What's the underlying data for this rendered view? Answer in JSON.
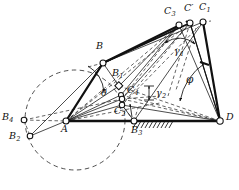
{
  "figure": {
    "width": 239,
    "height": 190,
    "background": "#ffffff",
    "stroke_color": "#111111",
    "dash_color": "#222222"
  },
  "labels": {
    "B": "B",
    "B1_base": "B",
    "B1_sub": "1",
    "B2_base": "B",
    "B2_sub": "2",
    "B3_base": "B",
    "B3_sub": "3",
    "B4_base": "B",
    "B4_sub": "4",
    "C1_base": "C",
    "C1_sub": "1",
    "C2_base": "C",
    "C2_sub": "2",
    "C3_base": "C",
    "C3_sub": "3",
    "C4_base": "C",
    "C4_sub": "4",
    "Cprime": "C′",
    "A": "A",
    "D": "D",
    "theta": "θ",
    "phi": "φ",
    "gamma1_base": "γ",
    "gamma1_sub": "1",
    "gamma2_base": "γ",
    "gamma2_sub": "2"
  },
  "nodes": [
    {
      "name": "A",
      "x": 66,
      "y": 121,
      "r": 3.0,
      "kind": "joint-open"
    },
    {
      "name": "B",
      "x": 103,
      "y": 63,
      "r": 3.0,
      "kind": "joint-open"
    },
    {
      "name": "B1",
      "x": 119,
      "y": 86,
      "r": 2.6,
      "kind": "joint-square"
    },
    {
      "name": "B2",
      "x": 30,
      "y": 136,
      "r": 2.8,
      "kind": "joint-open"
    },
    {
      "name": "B3",
      "x": 134,
      "y": 121,
      "r": 3.0,
      "kind": "joint-open"
    },
    {
      "name": "B4",
      "x": 24,
      "y": 120,
      "r": 2.8,
      "kind": "joint-open"
    },
    {
      "name": "C1",
      "x": 203,
      "y": 22,
      "r": 3.0,
      "kind": "joint-open"
    },
    {
      "name": "Cp",
      "x": 190,
      "y": 23,
      "r": 3.0,
      "kind": "joint-open"
    },
    {
      "name": "C3",
      "x": 179,
      "y": 25,
      "r": 3.0,
      "kind": "joint-open"
    },
    {
      "name": "C4",
      "x": 122,
      "y": 99,
      "r": 2.7,
      "kind": "joint-open"
    },
    {
      "name": "C2",
      "x": 122,
      "y": 105,
      "r": 2.7,
      "kind": "joint-open"
    },
    {
      "name": "Cm",
      "x": 121,
      "y": 95,
      "r": 2.5,
      "kind": "joint-open"
    },
    {
      "name": "D",
      "x": 220,
      "y": 121,
      "r": 3.2,
      "kind": "joint-open"
    }
  ],
  "label_positions": [
    {
      "key": "B",
      "x": 96,
      "y": 46
    },
    {
      "key": "B1",
      "x": 113,
      "y": 72
    },
    {
      "key": "B2",
      "x": 12,
      "y": 136
    },
    {
      "key": "B3",
      "x": 133,
      "y": 128
    },
    {
      "key": "B4",
      "x": 5,
      "y": 113
    },
    {
      "key": "C1",
      "x": 200,
      "y": 5
    },
    {
      "key": "Cprime",
      "x": 185,
      "y": 6
    },
    {
      "key": "C3",
      "x": 166,
      "y": 10
    },
    {
      "key": "C4",
      "x": 128,
      "y": 88
    },
    {
      "key": "C2",
      "x": 116,
      "y": 108
    },
    {
      "key": "A",
      "x": 62,
      "y": 126
    },
    {
      "key": "D",
      "x": 226,
      "y": 115
    },
    {
      "key": "theta",
      "x": 103,
      "y": 92
    },
    {
      "key": "phi",
      "x": 187,
      "y": 80
    },
    {
      "key": "gamma1",
      "x": 175,
      "y": 50
    },
    {
      "key": "gamma2",
      "x": 157,
      "y": 92
    }
  ],
  "geometry": {
    "ground_line": {
      "x1": 66,
      "y1": 121,
      "x2": 220,
      "y2": 121,
      "weight": "heavy"
    },
    "coupler_bar": {
      "points": "103,63 179,25",
      "weight": "heavy"
    },
    "crank_AB": {
      "points": "66,121 103,63",
      "weight": "heavy"
    },
    "rocker_CD": {
      "points": "203,22 220,121",
      "weight": "heavy"
    },
    "dashed_circle": {
      "cx": 75,
      "cy": 120,
      "r": 50
    },
    "hatch": {
      "x1": 136,
      "y1": 121,
      "x2": 172,
      "y2": 121,
      "count": 9
    },
    "tick_marks": [
      {
        "x": 205,
        "y": 65,
        "label": "rocker-tick"
      },
      {
        "x": 190,
        "y": 24,
        "label": "coupler-tick"
      }
    ]
  },
  "angles": {
    "gamma1": {
      "vertex_x": 181,
      "vertex_y": 26,
      "note": "transmission angle at coupler apex, double arrow arc"
    },
    "gamma2": {
      "note": "bracketed small angle near C4, vertical bracket with arrows"
    },
    "phi": {
      "vertex_x": 220,
      "vertex_y": 121,
      "note": "rocker swing angle at D, arc with arrow"
    },
    "theta": {
      "vertex_x": 66,
      "vertex_y": 121,
      "note": "crank angle at A, arc with arrow"
    }
  }
}
